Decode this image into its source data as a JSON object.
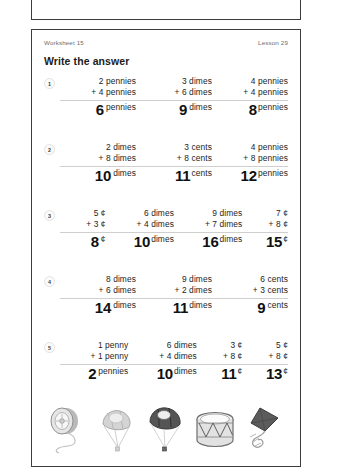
{
  "header": {
    "worksheet_label": "Worksheet 15",
    "lesson_label": "Lesson 29",
    "instruction": "Write the answer"
  },
  "problems": [
    {
      "number": "1",
      "columns": [
        {
          "top": "2 pennies",
          "addend": "+ 4 pennies",
          "answer": "6",
          "unit": "pennies"
        },
        {
          "top": "3 dimes",
          "addend": "+ 6 dimes",
          "answer": "9",
          "unit": "dimes"
        },
        {
          "top": "4 pennies",
          "addend": "+ 4 pennies",
          "answer": "8",
          "unit": "pennies"
        }
      ]
    },
    {
      "number": "2",
      "columns": [
        {
          "top": "2 dimes",
          "addend": "+ 8 dimes",
          "answer": "10",
          "unit": "dimes"
        },
        {
          "top": "3 cents",
          "addend": "+ 8 cents",
          "answer": "11",
          "unit": "cents"
        },
        {
          "top": "4 pennies",
          "addend": "+ 8 pennies",
          "answer": "12",
          "unit": "pennies"
        }
      ]
    },
    {
      "number": "3",
      "columns": [
        {
          "top": "5 ¢",
          "addend": "+ 3 ¢",
          "answer": "8",
          "unit": "¢"
        },
        {
          "top": "6 dimes",
          "addend": "+ 4 dimes",
          "answer": "10",
          "unit": "dimes"
        },
        {
          "top": "9 dimes",
          "addend": "+ 7 dimes",
          "answer": "16",
          "unit": "dimes"
        },
        {
          "top": "7 ¢",
          "addend": "+ 8 ¢",
          "answer": "15",
          "unit": "¢"
        }
      ]
    },
    {
      "number": "4",
      "columns": [
        {
          "top": "8 dimes",
          "addend": "+ 6 dimes",
          "answer": "14",
          "unit": "dimes"
        },
        {
          "top": "9 dimes",
          "addend": "+ 2 dimes",
          "answer": "11",
          "unit": "dimes"
        },
        {
          "top": "6 cents",
          "addend": "+ 3 cents",
          "answer": "9",
          "unit": "cents"
        }
      ]
    },
    {
      "number": "5",
      "columns": [
        {
          "top": "1 penny",
          "addend": "+ 1 penny",
          "answer": "2",
          "unit": "pennies"
        },
        {
          "top": "6 dimes",
          "addend": "+ 4 dimes",
          "answer": "10",
          "unit": "dimes"
        },
        {
          "top": "3 ¢",
          "addend": "+ 8 ¢",
          "answer": "11",
          "unit": "¢"
        },
        {
          "top": "5 ¢",
          "addend": "+ 8 ¢",
          "answer": "13",
          "unit": "¢"
        }
      ]
    }
  ],
  "illustrations": [
    {
      "name": "yo-yo"
    },
    {
      "name": "light-parachute"
    },
    {
      "name": "dark-parachute"
    },
    {
      "name": "drum"
    },
    {
      "name": "kite"
    }
  ]
}
